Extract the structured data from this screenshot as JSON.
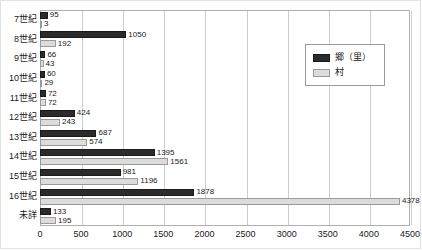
{
  "chart_data": {
    "type": "bar",
    "orientation": "horizontal",
    "title": "",
    "xlabel": "",
    "ylabel": "",
    "xlim": [
      0,
      4500
    ],
    "xticks": [
      0,
      500,
      1000,
      1500,
      2000,
      2500,
      3000,
      3500,
      4000,
      4500
    ],
    "grid": true,
    "legend_position": "top-right",
    "categories": [
      "7世紀",
      "8世紀",
      "9世紀",
      "10世紀",
      "11世紀",
      "12世紀",
      "13世紀",
      "14世紀",
      "15世紀",
      "16世紀",
      "未詳"
    ],
    "series": [
      {
        "name": "郷（里）",
        "color": "#2b2b2b",
        "values": [
          95,
          1050,
          66,
          60,
          72,
          424,
          687,
          1395,
          981,
          1878,
          133
        ]
      },
      {
        "name": "村",
        "color": "#dcdcdc",
        "values": [
          3,
          192,
          43,
          29,
          72,
          243,
          574,
          1561,
          1196,
          4378,
          195
        ]
      }
    ]
  }
}
